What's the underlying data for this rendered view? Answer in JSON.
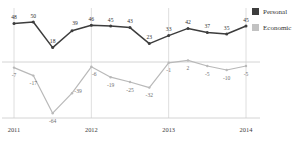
{
  "chart_data": {
    "type": "line",
    "title": "",
    "subtitle": "",
    "xlabel": "",
    "ylabel": "",
    "grid": true,
    "legend_position": "right",
    "ylim": [
      -70,
      60
    ],
    "xlim": [
      0,
      12
    ],
    "zero_line": 0,
    "x": [
      "2011 Q1",
      "2011 Q2",
      "2011 Q3",
      "2011 Q4",
      "2012 Q1",
      "2012 Q2",
      "2012 Q3",
      "2012 Q4",
      "2013 Q1",
      "2013 Q2",
      "2013 Q3",
      "2013 Q4",
      "2014 Q1"
    ],
    "tick_labels": [
      "2011",
      "2012",
      "2013",
      "2014"
    ],
    "tick_indices": [
      0,
      4,
      8,
      12
    ],
    "series": [
      {
        "name": "Personal",
        "color": "#3d3d3d",
        "values": [
          48,
          50,
          18,
          39,
          46,
          45,
          43,
          23,
          33,
          42,
          37,
          35,
          45
        ],
        "labels": [
          "48",
          "50",
          "18",
          "39",
          "46",
          "45",
          "43",
          "23",
          "33",
          "42",
          "37",
          "35",
          "45"
        ]
      },
      {
        "name": "Economic",
        "color": "#b9b9b9",
        "values": [
          -7,
          -17,
          -64,
          -39,
          -6,
          -19,
          -25,
          -32,
          -1,
          2,
          -5,
          -10,
          -5
        ],
        "labels": [
          "-7",
          "-17",
          "-64",
          "-39",
          "-6",
          "-19",
          "-25",
          "-32",
          "-1",
          "2",
          "-5",
          "-10",
          "-5"
        ]
      }
    ]
  },
  "legend": {
    "items": [
      {
        "label": "Personal",
        "color": "#3d3d3d"
      },
      {
        "label": "Economic",
        "color": "#c2c2c2"
      }
    ]
  },
  "axis": {
    "years": [
      "2011",
      "2012",
      "2013",
      "2014"
    ]
  },
  "colors": {
    "personal": "#3d3d3d",
    "economic": "#b9b9b9",
    "grid": "#d6d6d6",
    "axis": "#c9c9c9"
  }
}
